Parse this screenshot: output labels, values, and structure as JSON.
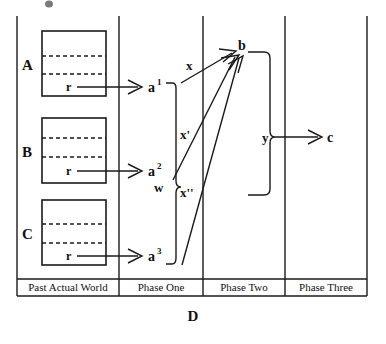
{
  "diagram": {
    "caption": "D",
    "columns": [
      {
        "id": "past-actual-world",
        "label": "Past Actual World"
      },
      {
        "id": "phase-one",
        "label": "Phase One"
      },
      {
        "id": "phase-two",
        "label": "Phase Two"
      },
      {
        "id": "phase-three",
        "label": "Phase Three"
      }
    ],
    "world_boxes": [
      {
        "id": "A",
        "label": "A",
        "inner_label": "r"
      },
      {
        "id": "B",
        "label": "B",
        "inner_label": "r"
      },
      {
        "id": "C",
        "label": "C",
        "inner_label": "r"
      }
    ],
    "phase_one_nodes": [
      {
        "id": "a1",
        "base": "a",
        "superscript": "1"
      },
      {
        "id": "a2",
        "base": "a",
        "superscript": "2"
      },
      {
        "id": "a3",
        "base": "a",
        "superscript": "3"
      }
    ],
    "phase_two_nodes": [
      {
        "id": "b",
        "label": "b"
      }
    ],
    "phase_three_nodes": [
      {
        "id": "c",
        "label": "c"
      }
    ],
    "edge_labels": [
      {
        "id": "x",
        "label": "x",
        "from": "a1",
        "to": "b"
      },
      {
        "id": "x-prime",
        "label": "x'",
        "from": "a2",
        "to": "b"
      },
      {
        "id": "x-double-prime",
        "label": "x''",
        "from": "a3",
        "to": "b"
      }
    ],
    "brace_labels": [
      {
        "id": "w",
        "label": "w",
        "spans": [
          "a1",
          "a2",
          "a3"
        ]
      },
      {
        "id": "y",
        "label": "y",
        "spans": [
          "b"
        ]
      }
    ]
  },
  "colors": {
    "ink": "#1a1a1a",
    "background": "#ffffff"
  }
}
